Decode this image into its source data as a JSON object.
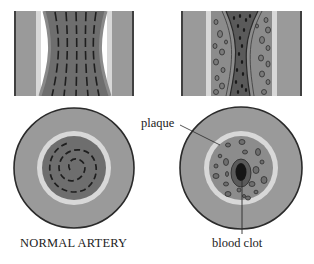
{
  "figure": {
    "type": "medical-illustration"
  },
  "labels": {
    "normal_artery": "NORMAL ARTERY",
    "plaque": "plaque",
    "blood_clot": "blood clot"
  },
  "panels": [
    {
      "id": "normal-longitudinal",
      "view": "longitudinal section",
      "condition": "normal"
    },
    {
      "id": "diseased-longitudinal",
      "view": "longitudinal section",
      "condition": "narrowed by plaque"
    },
    {
      "id": "normal-cross-section",
      "view": "cross section",
      "condition": "normal",
      "caption": "NORMAL ARTERY"
    },
    {
      "id": "diseased-cross-section",
      "view": "cross section",
      "condition": "plaque with blood clot",
      "annotations": [
        "plaque",
        "blood clot"
      ]
    }
  ],
  "colors": {
    "outer_wall": "#9a9a9a",
    "wall_outline": "#2a2a2a",
    "intima_ring": "#d8d8d8",
    "lumen_blood": "#6e6e6e",
    "plaque_fill": "#8c8c8c",
    "clot": "#151515",
    "background": "#ffffff"
  }
}
